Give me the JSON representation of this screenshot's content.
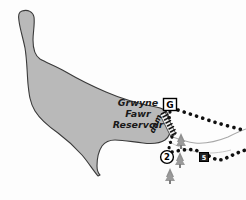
{
  "map": {
    "title": "Grwyne Fawr Reservoir",
    "background_color": "#fdfdfd",
    "water_fill": "#b9b9b9",
    "water_stroke": "#3a3a3a",
    "trail_color": "#101010",
    "tree_color": "#8f8f8f",
    "river_color": "#9a9a9a",
    "dam_color": "#141414",
    "labels": {
      "reservoir_line1": "Grwyne",
      "reservoir_line2": "Fawr",
      "reservoir_line3": "Reservoir",
      "dam": "dam"
    },
    "markers": [
      {
        "id": "marker-g",
        "label": "G",
        "shape": "square",
        "x": 170,
        "y": 105
      },
      {
        "id": "marker-2",
        "label": "2",
        "shape": "circle",
        "x": 167,
        "y": 157
      },
      {
        "id": "marker-5",
        "label": "5",
        "shape": "square-small",
        "x": 204,
        "y": 157
      }
    ],
    "trails": [
      {
        "id": "trail-north",
        "from": "G",
        "description": "dotted path east from G"
      },
      {
        "id": "trail-south",
        "from": "2",
        "description": "dotted path east from 2 via 5"
      }
    ],
    "trees": [
      {
        "x": 181,
        "y": 141
      },
      {
        "x": 180,
        "y": 160
      },
      {
        "x": 170,
        "y": 176
      }
    ]
  }
}
